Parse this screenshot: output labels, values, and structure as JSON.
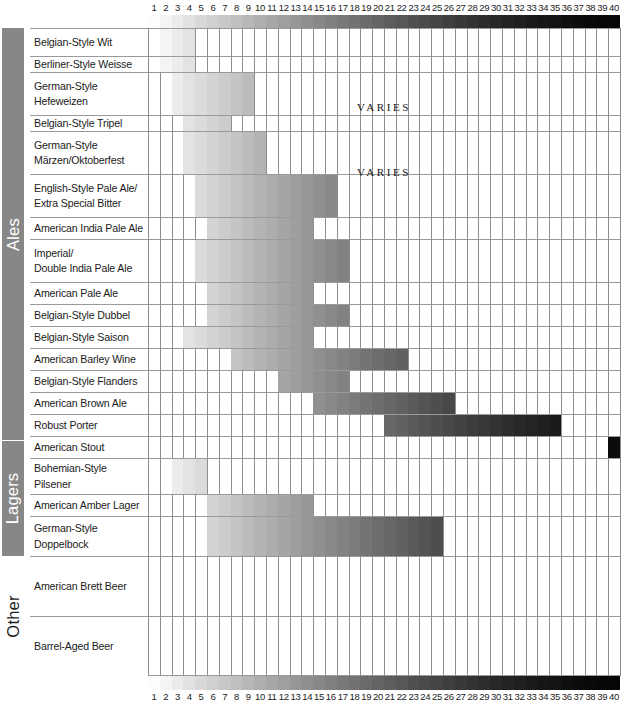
{
  "chart_data": {
    "type": "bar",
    "xlabel": "SRM",
    "ylabel": "Beer Style",
    "xlim": [
      1,
      40
    ],
    "grid": true,
    "legend": "none",
    "orientation": "horizontal-range",
    "axis_ticks": [
      "1",
      "2",
      "3",
      "4",
      "5",
      "6",
      "7",
      "8",
      "9",
      "10",
      "11",
      "12",
      "13",
      "14",
      "15",
      "16",
      "17",
      "18",
      "19",
      "20",
      "21",
      "22",
      "23",
      "24",
      "25",
      "26",
      "27",
      "28",
      "29",
      "30",
      "31",
      "32",
      "33",
      "34",
      "35",
      "36",
      "37",
      "38",
      "39",
      "40"
    ],
    "categories": [
      "Belgian-Style Wit",
      "Berliner-Style Weisse",
      "German-Style Hefeweizen",
      "Belgian-Style Tripel",
      "German-Style Märzen/Oktoberfest",
      "English-Style Pale Ale/ Extra Special Bitter",
      "American India Pale Ale",
      "Imperial/ Double India Pale Ale",
      "American Pale Ale",
      "Belgian-Style Dubbel",
      "Belgian-Style Saison",
      "American Barley Wine",
      "Belgian-Style Flanders",
      "American Brown Ale",
      "Robust Porter",
      "American Stout",
      "Bohemian-Style Pilsener",
      "American Amber Lager",
      "German-Style Doppelbock",
      "American Brett Beer",
      "Barrel-Aged Beer"
    ],
    "ranges": [
      {
        "style": "Belgian-Style Wit",
        "srm_min": 2,
        "srm_max": 4
      },
      {
        "style": "Berliner-Style Weisse",
        "srm_min": 2,
        "srm_max": 4
      },
      {
        "style": "German-Style Hefeweizen",
        "srm_min": 3,
        "srm_max": 9
      },
      {
        "style": "Belgian-Style Tripel",
        "srm_min": 4,
        "srm_max": 7
      },
      {
        "style": "German-Style Märzen/Oktoberfest",
        "srm_min": 4,
        "srm_max": 10
      },
      {
        "style": "English-Style Pale Ale/ Extra Special Bitter",
        "srm_min": 5,
        "srm_max": 16
      },
      {
        "style": "American India Pale Ale",
        "srm_min": 6,
        "srm_max": 14
      },
      {
        "style": "Imperial/ Double India Pale Ale",
        "srm_min": 5,
        "srm_max": 17
      },
      {
        "style": "American Pale Ale",
        "srm_min": 6,
        "srm_max": 14
      },
      {
        "style": "Belgian-Style Dubbel",
        "srm_min": 6,
        "srm_max": 17
      },
      {
        "style": "Belgian-Style Saison",
        "srm_min": 4,
        "srm_max": 14
      },
      {
        "style": "American Barley Wine",
        "srm_min": 8,
        "srm_max": 22
      },
      {
        "style": "Belgian-Style Flanders",
        "srm_min": 12,
        "srm_max": 17
      },
      {
        "style": "American Brown Ale",
        "srm_min": 15,
        "srm_max": 26
      },
      {
        "style": "Robust Porter",
        "srm_min": 21,
        "srm_max": 35
      },
      {
        "style": "American Stout",
        "srm_min": 40,
        "srm_max": 40
      },
      {
        "style": "Bohemian-Style Pilsener",
        "srm_min": 3,
        "srm_max": 5
      },
      {
        "style": "American Amber Lager",
        "srm_min": 6,
        "srm_max": 14
      },
      {
        "style": "German-Style Doppelbock",
        "srm_min": 6,
        "srm_max": 25
      },
      {
        "style": "American Brett Beer",
        "srm_min": null,
        "srm_max": null,
        "note": "VARIES"
      },
      {
        "style": "Barrel-Aged Beer",
        "srm_min": null,
        "srm_max": null,
        "note": "VARIES"
      }
    ],
    "srm_scale_colors": [
      "#f8f4d0",
      "#f6f0b8",
      "#f3e79b",
      "#f0dd7d",
      "#eed364",
      "#eac44e",
      "#e4b53c",
      "#dda42c",
      "#d59420",
      "#cc8418",
      "#c27613",
      "#b86a10",
      "#ad5e0e",
      "#a2530d",
      "#97490c",
      "#8c400b",
      "#81380a",
      "#763009",
      "#6b2a08",
      "#612407",
      "#571f06",
      "#4d1a06",
      "#441605",
      "#3b1305",
      "#331004",
      "#2c0e04",
      "#250c03",
      "#1f0a03",
      "#1a0903",
      "#160802",
      "#120702",
      "#0f0602",
      "#0c0502",
      "#0a0401",
      "#080401",
      "#070301",
      "#060301",
      "#050201",
      "#040201",
      "#030101"
    ]
  },
  "axis": {
    "ticks": [
      "1",
      "2",
      "3",
      "4",
      "5",
      "6",
      "7",
      "8",
      "9",
      "10",
      "11",
      "12",
      "13",
      "14",
      "15",
      "16",
      "17",
      "18",
      "19",
      "20",
      "21",
      "22",
      "23",
      "24",
      "25",
      "26",
      "27",
      "28",
      "29",
      "30",
      "31",
      "32",
      "33",
      "34",
      "35",
      "36",
      "37",
      "38",
      "39",
      "40"
    ]
  },
  "categories_spine": [
    {
      "name": "Ales",
      "label": "Ales"
    },
    {
      "name": "Lagers",
      "label": "Lagers"
    },
    {
      "name": "Other",
      "label": "Other"
    }
  ],
  "rows": [
    {
      "id": "belgian-style-wit",
      "line1": "Belgian-Style Wit",
      "line2": ""
    },
    {
      "id": "berliner-style-weisse",
      "line1": "Berliner-Style Weisse",
      "line2": ""
    },
    {
      "id": "german-style-hefeweizen",
      "line1": "German-Style",
      "line2": "Hefeweizen"
    },
    {
      "id": "belgian-style-tripel",
      "line1": "Belgian-Style Tripel",
      "line2": ""
    },
    {
      "id": "german-style-marzen-oktoberfest",
      "line1": "German-Style",
      "line2": "Märzen/Oktoberfest"
    },
    {
      "id": "english-style-pale-ale-esb",
      "line1": "English-Style Pale Ale/",
      "line2": "Extra Special Bitter"
    },
    {
      "id": "american-india-pale-ale",
      "line1": "American India Pale Ale",
      "line2": ""
    },
    {
      "id": "imperial-double-india-pale-ale",
      "line1": "Imperial/",
      "line2": "Double India Pale Ale"
    },
    {
      "id": "american-pale-ale",
      "line1": "American Pale Ale",
      "line2": ""
    },
    {
      "id": "belgian-style-dubbel",
      "line1": "Belgian-Style Dubbel",
      "line2": ""
    },
    {
      "id": "belgian-style-saison",
      "line1": "Belgian-Style Saison",
      "line2": ""
    },
    {
      "id": "american-barley-wine",
      "line1": "American Barley Wine",
      "line2": ""
    },
    {
      "id": "belgian-style-flanders",
      "line1": "Belgian-Style Flanders",
      "line2": ""
    },
    {
      "id": "american-brown-ale",
      "line1": "American Brown Ale",
      "line2": ""
    },
    {
      "id": "robust-porter",
      "line1": "Robust Porter",
      "line2": ""
    },
    {
      "id": "american-stout",
      "line1": "American Stout",
      "line2": ""
    },
    {
      "id": "bohemian-style-pilsener",
      "line1": "Bohemian-Style",
      "line2": "Pilsener"
    },
    {
      "id": "american-amber-lager",
      "line1": "American Amber Lager",
      "line2": ""
    },
    {
      "id": "german-style-doppelbock",
      "line1": "German-Style",
      "line2": "Doppelbock"
    },
    {
      "id": "american-brett-beer",
      "line1": "American Brett Beer",
      "line2": ""
    },
    {
      "id": "barrel-aged-beer",
      "line1": "Barrel-Aged Beer",
      "line2": ""
    }
  ],
  "varies": {
    "american_brett": "VARIES",
    "barrel_aged": "VARIES"
  },
  "colors": {
    "spine_bg": "#878787",
    "grid_line": "#8d8d8d",
    "row_line": "#9a9a9a",
    "text": "#1b1b1b",
    "page_bg": "#ffffff"
  }
}
